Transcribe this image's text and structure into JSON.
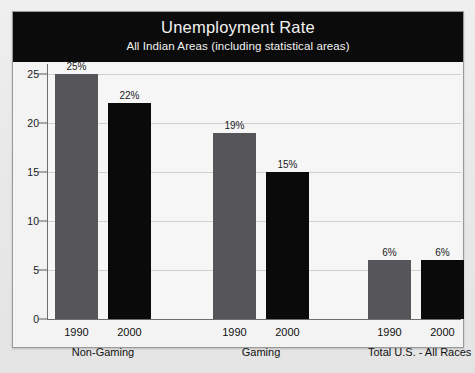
{
  "chart_data": {
    "type": "bar",
    "title": "Unemployment Rate",
    "subtitle": "All Indian Areas (including statistical areas)",
    "xlabel": "",
    "ylabel": "",
    "ylim": [
      0,
      26
    ],
    "yticks": [
      0,
      5,
      10,
      15,
      20,
      25
    ],
    "ytick_labels": [
      "0",
      "5",
      "10",
      "15",
      "20",
      "25"
    ],
    "grid": true,
    "legend": "none",
    "categories": [
      "Non-Gaming",
      "Gaming",
      "Total U.S. - All Races"
    ],
    "series": [
      {
        "name": "1990",
        "color": "#56565a",
        "values": [
          25,
          19,
          6
        ],
        "labels": [
          "25%",
          "19%",
          "6%"
        ]
      },
      {
        "name": "2000",
        "color": "#0a0a0a",
        "values": [
          22,
          15,
          6
        ],
        "labels": [
          "22%",
          "15%",
          "6%"
        ]
      }
    ],
    "groups": [
      {
        "group_label": "Non-Gaming",
        "bars": [
          {
            "year": "1990",
            "value": 25,
            "label": "25%",
            "series": "1990"
          },
          {
            "year": "2000",
            "value": 22,
            "label": "22%",
            "series": "2000"
          }
        ]
      },
      {
        "group_label": "Gaming",
        "bars": [
          {
            "year": "1990",
            "value": 19,
            "label": "19%",
            "series": "1990"
          },
          {
            "year": "2000",
            "value": 15,
            "label": "15%",
            "series": "2000"
          }
        ]
      },
      {
        "group_label": "Total U.S. - All Races",
        "bars": [
          {
            "year": "1990",
            "value": 6,
            "label": "6%",
            "series": "1990"
          },
          {
            "year": "2000",
            "value": 6,
            "label": "6%",
            "series": "2000"
          }
        ]
      }
    ]
  },
  "colors": {
    "title_band_bg": "#0b0b0b",
    "title_text": "#f2f2f2",
    "plot_bg": "#f6f6f6",
    "gridline": "#d0d0d0",
    "axis": "#6e6e6e",
    "bar_1990": "#56565a",
    "bar_2000": "#0a0a0a",
    "page_bg": "#e8e8e8"
  }
}
